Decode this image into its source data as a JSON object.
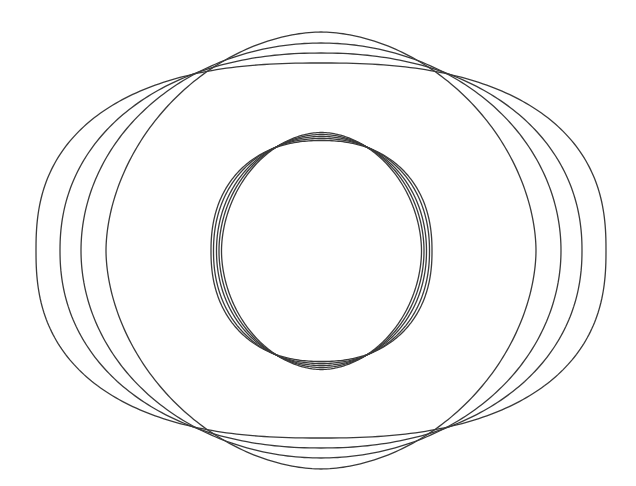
{
  "figure": {
    "width": 636,
    "height": 486,
    "background": "#ffffff",
    "stroke_color": "#3a3a3a"
  },
  "outer_family": {
    "center": [
      321,
      250.5
    ],
    "common_points": [
      [
        192,
        74
      ],
      [
        450,
        75
      ],
      [
        192,
        424
      ],
      [
        445,
        428
      ]
    ],
    "curves": [
      {
        "a": 285,
        "b": 187.5,
        "n": 2.45
      },
      {
        "a": 261,
        "b": 197.5,
        "n": 2.15
      },
      {
        "a": 240,
        "b": 207.5,
        "n": 2.0
      },
      {
        "a": 215,
        "b": 218.5,
        "n": 1.85
      }
    ]
  },
  "inner_family": {
    "center": [
      321.5,
      251
    ],
    "curves": [
      {
        "a": 110.5,
        "b": 110.5,
        "n": 2.25
      },
      {
        "a": 108,
        "b": 112.5,
        "n": 2.15
      },
      {
        "a": 105,
        "b": 114.5,
        "n": 2.05
      },
      {
        "a": 102.5,
        "b": 116.5,
        "n": 1.97
      },
      {
        "a": 100,
        "b": 118.5,
        "n": 1.9
      }
    ]
  }
}
